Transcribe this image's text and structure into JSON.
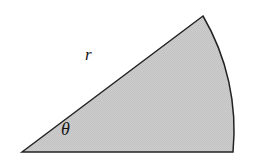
{
  "figure": {
    "name": "circular-sector-diagram",
    "background_color": "#ffffff",
    "fill_color": "#c8c8c8",
    "stroke_color": "#222222",
    "stroke_width": 1.5,
    "labels": {
      "radius": "r",
      "angle": "θ"
    },
    "geometry": {
      "apex": [
        22,
        152
      ],
      "arc_start": [
        203,
        16
      ],
      "arc_end": [
        233,
        152
      ],
      "arc_bulge_x": 243,
      "baseline_y": 152,
      "radius_px": 226
    }
  }
}
